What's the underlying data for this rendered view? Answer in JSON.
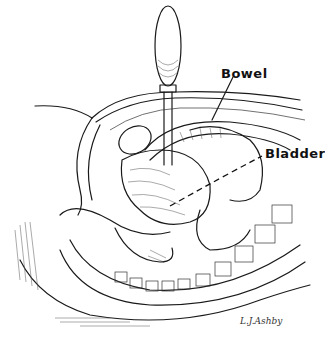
{
  "figure": {
    "labels": {
      "bowel": "Bowel",
      "bladder": "Bladder"
    },
    "signature": "L.J.Ashby",
    "colors": {
      "ink": "#1a1a1a",
      "background": "#ffffff"
    }
  }
}
